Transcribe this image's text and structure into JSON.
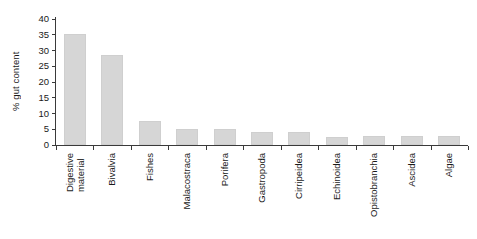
{
  "chart_data": {
    "type": "bar",
    "title": "",
    "xlabel": "",
    "ylabel": "% gut content",
    "ylim": [
      0,
      40
    ],
    "yticks": [
      0,
      5,
      10,
      15,
      20,
      25,
      30,
      35,
      40
    ],
    "ytick_labels": [
      "0",
      "5",
      "10",
      "15",
      "20",
      "25",
      "30",
      "35",
      "40"
    ],
    "grid": false,
    "legend": null,
    "bar_color": "#d6d6d6",
    "bar_edge_color": "#cfcfcf",
    "axis_color": "#3a3a3a",
    "categories": [
      "Digestive\nmaterial",
      "Bivalvia",
      "Fishes",
      "Malacostraca",
      "Porifera",
      "Gastropoda",
      "Cirripeidea",
      "Echinoidea",
      "Opistobranchia",
      "Ascidea",
      "Algae"
    ],
    "values": [
      35.3,
      28.5,
      7.5,
      5.2,
      5.0,
      4.0,
      4.0,
      2.7,
      3.0,
      3.0,
      3.0
    ]
  }
}
